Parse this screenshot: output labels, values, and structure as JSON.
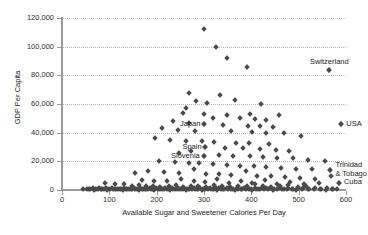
{
  "chart_data": {
    "type": "scatter",
    "title": "",
    "xlabel": "Available Sugar and Sweetener Calories Per Day",
    "ylabel": "GDP Per Capita",
    "xlim": [
      0,
      600
    ],
    "ylim": [
      0,
      120000
    ],
    "xticks": [
      0,
      100,
      200,
      300,
      400,
      500,
      600
    ],
    "xtick_labels": [
      "0",
      "100",
      "200",
      "300",
      "400",
      "500",
      "600"
    ],
    "yticks": [
      0,
      20000,
      40000,
      60000,
      80000,
      100000,
      120000
    ],
    "ytick_labels": [
      "0",
      "20,000",
      "40,000",
      "60,000",
      "80,000",
      "100,000",
      "120,000"
    ],
    "grid": "horizontal-dotted",
    "legend": "none",
    "marker": "diamond",
    "marker_color": "#4a4a4a",
    "annotations": [
      {
        "label": "Switzerland",
        "x": 565,
        "y": 84000,
        "anchor": "above"
      },
      {
        "label": "USA",
        "x": 590,
        "y": 46000,
        "anchor": "right"
      },
      {
        "label": "Japan",
        "x": 300,
        "y": 46000,
        "anchor": "left"
      },
      {
        "label": "Spain",
        "x": 303,
        "y": 30000,
        "anchor": "left"
      },
      {
        "label": "Slovenia",
        "x": 300,
        "y": 23500,
        "anchor": "left"
      },
      {
        "label": "Trinidad\n& Tobago",
        "x": 567,
        "y": 14000,
        "anchor": "right"
      },
      {
        "label": "Cuba",
        "x": 585,
        "y": 5000,
        "anchor": "right"
      }
    ],
    "points": [
      [
        300,
        112000
      ],
      [
        325,
        99500
      ],
      [
        348,
        92000
      ],
      [
        390,
        85500
      ],
      [
        565,
        84000
      ],
      [
        268,
        68000
      ],
      [
        333,
        66500
      ],
      [
        365,
        63000
      ],
      [
        283,
        62000
      ],
      [
        306,
        60500
      ],
      [
        420,
        60000
      ],
      [
        262,
        57000
      ],
      [
        255,
        54000
      ],
      [
        300,
        53000
      ],
      [
        348,
        52500
      ],
      [
        398,
        53000
      ],
      [
        458,
        52000
      ],
      [
        318,
        50000
      ],
      [
        375,
        50000
      ],
      [
        408,
        49500
      ],
      [
        430,
        48500
      ],
      [
        235,
        48000
      ],
      [
        268,
        47000
      ],
      [
        300,
        46000
      ],
      [
        590,
        46000
      ],
      [
        340,
        45500
      ],
      [
        392,
        45000
      ],
      [
        418,
        44500
      ],
      [
        446,
        44000
      ],
      [
        212,
        43000
      ],
      [
        245,
        42000
      ],
      [
        282,
        41000
      ],
      [
        358,
        41000
      ],
      [
        402,
        40500
      ],
      [
        430,
        40000
      ],
      [
        470,
        39500
      ],
      [
        505,
        38000
      ],
      [
        196,
        36000
      ],
      [
        228,
        35000
      ],
      [
        262,
        34500
      ],
      [
        295,
        34000
      ],
      [
        322,
        33500
      ],
      [
        368,
        33000
      ],
      [
        395,
        32500
      ],
      [
        438,
        32000
      ],
      [
        303,
        30000
      ],
      [
        345,
        29500
      ],
      [
        382,
        29000
      ],
      [
        418,
        28500
      ],
      [
        452,
        28000
      ],
      [
        480,
        27500
      ],
      [
        272,
        27000
      ],
      [
        248,
        26000
      ],
      [
        300,
        23500
      ],
      [
        332,
        24500
      ],
      [
        362,
        24000
      ],
      [
        398,
        23500
      ],
      [
        425,
        23000
      ],
      [
        455,
        22500
      ],
      [
        488,
        22000
      ],
      [
        520,
        21000
      ],
      [
        555,
        20000
      ],
      [
        205,
        20000
      ],
      [
        238,
        19500
      ],
      [
        268,
        19000
      ],
      [
        290,
        18500
      ],
      [
        318,
        18000
      ],
      [
        348,
        17500
      ],
      [
        375,
        17000
      ],
      [
        405,
        16500
      ],
      [
        432,
        16000
      ],
      [
        462,
        15500
      ],
      [
        495,
        15000
      ],
      [
        528,
        14500
      ],
      [
        567,
        14000
      ],
      [
        182,
        13000
      ],
      [
        215,
        12500
      ],
      [
        248,
        12000
      ],
      [
        278,
        14500
      ],
      [
        305,
        11500
      ],
      [
        332,
        11000
      ],
      [
        358,
        10500
      ],
      [
        388,
        13000
      ],
      [
        412,
        10000
      ],
      [
        442,
        9500
      ],
      [
        472,
        9000
      ],
      [
        502,
        8500
      ],
      [
        535,
        8000
      ],
      [
        568,
        9500
      ],
      [
        155,
        12000
      ],
      [
        168,
        7000
      ],
      [
        195,
        6500
      ],
      [
        222,
        6000
      ],
      [
        252,
        7500
      ],
      [
        278,
        6000
      ],
      [
        302,
        5500
      ],
      [
        328,
        8000
      ],
      [
        352,
        5000
      ],
      [
        378,
        6500
      ],
      [
        402,
        5000
      ],
      [
        428,
        7000
      ],
      [
        455,
        4500
      ],
      [
        482,
        5500
      ],
      [
        512,
        4000
      ],
      [
        542,
        5000
      ],
      [
        585,
        5000
      ],
      [
        90,
        5000
      ],
      [
        112,
        4500
      ],
      [
        132,
        4000
      ],
      [
        148,
        3000
      ],
      [
        162,
        3500
      ],
      [
        178,
        2500
      ],
      [
        192,
        3000
      ],
      [
        208,
        2000
      ],
      [
        225,
        2500
      ],
      [
        240,
        3500
      ],
      [
        255,
        2000
      ],
      [
        272,
        3000
      ],
      [
        288,
        2500
      ],
      [
        305,
        2000
      ],
      [
        322,
        3500
      ],
      [
        338,
        2500
      ],
      [
        355,
        2000
      ],
      [
        372,
        3000
      ],
      [
        390,
        2500
      ],
      [
        408,
        4000
      ],
      [
        425,
        3000
      ],
      [
        442,
        2000
      ],
      [
        460,
        2500
      ],
      [
        478,
        3500
      ],
      [
        498,
        2000
      ],
      [
        515,
        3000
      ],
      [
        45,
        800
      ],
      [
        52,
        1000
      ],
      [
        58,
        600
      ],
      [
        65,
        1200
      ],
      [
        72,
        700
      ],
      [
        78,
        1500
      ],
      [
        85,
        900
      ],
      [
        92,
        1100
      ],
      [
        98,
        600
      ],
      [
        105,
        1300
      ],
      [
        112,
        800
      ],
      [
        118,
        1000
      ],
      [
        125,
        700
      ],
      [
        132,
        1400
      ],
      [
        138,
        900
      ],
      [
        145,
        600
      ],
      [
        152,
        1200
      ],
      [
        158,
        800
      ],
      [
        165,
        1500
      ],
      [
        172,
        1000
      ],
      [
        178,
        700
      ],
      [
        185,
        1300
      ],
      [
        192,
        900
      ],
      [
        198,
        1600
      ],
      [
        205,
        1100
      ],
      [
        212,
        700
      ],
      [
        218,
        1400
      ],
      [
        225,
        900
      ],
      [
        232,
        1200
      ],
      [
        238,
        800
      ],
      [
        245,
        1500
      ],
      [
        252,
        1000
      ],
      [
        258,
        1300
      ],
      [
        265,
        900
      ],
      [
        272,
        1700
      ],
      [
        278,
        1100
      ],
      [
        285,
        800
      ],
      [
        292,
        1400
      ],
      [
        298,
        1000
      ],
      [
        305,
        1600
      ],
      [
        312,
        1200
      ],
      [
        318,
        900
      ],
      [
        325,
        1500
      ],
      [
        332,
        1100
      ],
      [
        340,
        700
      ],
      [
        348,
        1300
      ],
      [
        355,
        1800
      ],
      [
        362,
        1000
      ],
      [
        370,
        1400
      ],
      [
        378,
        900
      ],
      [
        385,
        1600
      ],
      [
        392,
        1200
      ],
      [
        400,
        800
      ],
      [
        408,
        1500
      ],
      [
        415,
        1000
      ],
      [
        422,
        1300
      ],
      [
        432,
        1700
      ],
      [
        440,
        1100
      ],
      [
        448,
        900
      ],
      [
        458,
        1400
      ],
      [
        468,
        1000
      ],
      [
        478,
        1200
      ],
      [
        488,
        800
      ],
      [
        498,
        1500
      ],
      [
        510,
        1100
      ],
      [
        522,
        900
      ],
      [
        535,
        1300
      ],
      [
        548,
        1000
      ],
      [
        560,
        1200
      ],
      [
        572,
        900
      ],
      [
        60,
        400
      ],
      [
        68,
        300
      ],
      [
        75,
        500
      ],
      [
        82,
        350
      ],
      [
        88,
        450
      ],
      [
        95,
        300
      ],
      [
        102,
        500
      ],
      [
        108,
        400
      ],
      [
        115,
        350
      ],
      [
        122,
        450
      ],
      [
        128,
        300
      ],
      [
        135,
        500
      ],
      [
        142,
        400
      ],
      [
        148,
        350
      ],
      [
        155,
        450
      ],
      [
        162,
        300
      ],
      [
        168,
        500
      ],
      [
        175,
        400
      ],
      [
        182,
        350
      ],
      [
        188,
        450
      ],
      [
        195,
        300
      ],
      [
        202,
        500
      ],
      [
        208,
        400
      ],
      [
        215,
        350
      ],
      [
        222,
        450
      ],
      [
        228,
        300
      ],
      [
        235,
        500
      ],
      [
        242,
        400
      ],
      [
        248,
        350
      ],
      [
        255,
        450
      ],
      [
        262,
        300
      ],
      [
        268,
        500
      ],
      [
        275,
        400
      ],
      [
        282,
        350
      ],
      [
        288,
        450
      ],
      [
        295,
        300
      ],
      [
        302,
        500
      ],
      [
        308,
        400
      ],
      [
        315,
        350
      ],
      [
        322,
        450
      ],
      [
        328,
        300
      ],
      [
        335,
        500
      ],
      [
        342,
        400
      ],
      [
        350,
        350
      ],
      [
        358,
        450
      ],
      [
        365,
        300
      ],
      [
        372,
        500
      ],
      [
        380,
        400
      ],
      [
        388,
        350
      ],
      [
        395,
        450
      ],
      [
        402,
        300
      ],
      [
        410,
        500
      ],
      [
        418,
        400
      ],
      [
        426,
        350
      ],
      [
        435,
        450
      ],
      [
        445,
        300
      ],
      [
        455,
        500
      ],
      [
        465,
        400
      ],
      [
        475,
        350
      ],
      [
        485,
        450
      ],
      [
        495,
        300
      ],
      [
        508,
        500
      ],
      [
        520,
        400
      ],
      [
        532,
        350
      ],
      [
        545,
        450
      ],
      [
        558,
        300
      ],
      [
        570,
        500
      ],
      [
        582,
        400
      ]
    ]
  }
}
